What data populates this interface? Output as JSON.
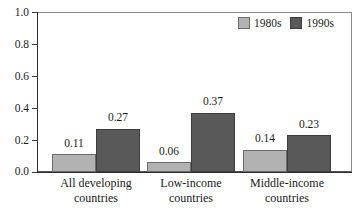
{
  "chart_data": {
    "type": "bar",
    "title": "",
    "subtitle": "",
    "xlabel": "",
    "ylabel": "",
    "ylim": [
      0.0,
      1.0
    ],
    "yticks": [
      "0.0",
      "0.2",
      "0.4",
      "0.6",
      "0.8",
      "1.0"
    ],
    "ytick_values": [
      0.0,
      0.2,
      0.4,
      0.6,
      0.8,
      1.0
    ],
    "grid": false,
    "legend_position": "top-right-inside",
    "categories": [
      "All developing countries",
      "Low-income countries",
      "Middle-income countries"
    ],
    "category_lines": [
      [
        "All developing",
        "countries"
      ],
      [
        "Low-income",
        "countries"
      ],
      [
        "Middle-income",
        "countries"
      ]
    ],
    "series": [
      {
        "name": "1980s",
        "color": "#b2b2b2",
        "values": [
          0.11,
          0.06,
          0.14
        ],
        "labels": [
          "0.11",
          "0.06",
          "0.14"
        ]
      },
      {
        "name": "1990s",
        "color": "#595959",
        "values": [
          0.27,
          0.37,
          0.23
        ],
        "labels": [
          "0.27",
          "0.37",
          "0.23"
        ]
      }
    ]
  },
  "legend": {
    "entries": [
      {
        "label": "1980s",
        "color": "#b2b2b2"
      },
      {
        "label": "1990s",
        "color": "#595959"
      }
    ]
  },
  "colors": {
    "series_1980s": "#b2b2b2",
    "series_1990s": "#595959",
    "axis": "#2e2e2e",
    "frame": "#8a8a8a",
    "text": "#1a1a1a",
    "background": "#ffffff"
  }
}
